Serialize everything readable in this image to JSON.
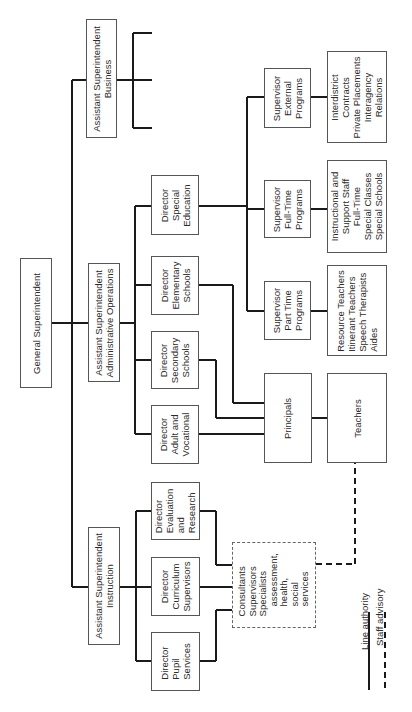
{
  "chart": {
    "type": "org-chart",
    "orientation": "rotated-90-ccw",
    "nodes": {
      "general": [
        "General Superintendent"
      ],
      "asst_business": [
        "Assistant Superintendent",
        "Business"
      ],
      "asst_admin": [
        "Assistant Superintendent",
        "Administrative Operations"
      ],
      "asst_instruction": [
        "Assistant Superintendent",
        "Instruction"
      ],
      "dir_special_ed": [
        "Director",
        "Special",
        "Education"
      ],
      "dir_elementary": [
        "Director",
        "Elementary",
        "Schools"
      ],
      "dir_secondary": [
        "Director",
        "Secondary",
        "Schools"
      ],
      "dir_adult": [
        "Director",
        "Adult and",
        "Vocational"
      ],
      "dir_evaluation": [
        "Director",
        "Evaluation",
        "and",
        "Research"
      ],
      "dir_curriculum": [
        "Director",
        "Curriculum",
        "Supervisors"
      ],
      "dir_pupil": [
        "Director",
        "Pupil",
        "Services"
      ],
      "sup_external": [
        "Supervisor",
        "External",
        "Programs"
      ],
      "sup_fulltime": [
        "Supervisor",
        "Full-Time",
        "Programs"
      ],
      "sup_parttime": [
        "Supervisor",
        "Part Time",
        "Programs"
      ],
      "external_list": [
        "Interdistrict",
        "Contracts",
        "Private Placements",
        "Interagency",
        "Relations"
      ],
      "fulltime_list": [
        "Instructional and",
        "Support Staff",
        "Full-Time",
        "Special Classes",
        "Special Schools"
      ],
      "parttime_list": [
        "Resource Teachers",
        "Itinerant Teachers",
        "Speech Therapists",
        "Aides"
      ],
      "principals": [
        "Principals"
      ],
      "teachers": [
        "Teachers"
      ],
      "consultants": [
        "Consultants",
        "Supervisors",
        "Specialists",
        "assessment,",
        "health,",
        "social",
        "services"
      ]
    },
    "legend": {
      "line_authority": "Line authority",
      "staff_advisory": "Staff advisory"
    },
    "colors": {
      "line": "#1a1a1a",
      "border": "#555555",
      "text": "#2a2a2a"
    }
  }
}
